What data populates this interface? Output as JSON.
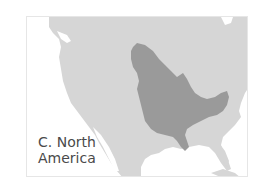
{
  "map": {
    "label_line1": "C. North",
    "label_line2": "America",
    "region_name": "C. North America",
    "colors": {
      "background": "#ffffff",
      "frame_border": "#e6e6e6",
      "land": "#d6d6d6",
      "highlighted_region": "#9a9a9a",
      "water": "#ffffff",
      "label_text": "#4a4a4a"
    },
    "highlighted_feature": "mississippi-river-basin"
  }
}
